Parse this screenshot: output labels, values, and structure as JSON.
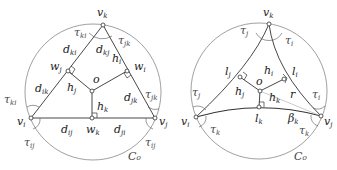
{
  "left_diagram": {
    "circle_label": "C₀",
    "vertices": {
      "vi": "v",
      "vi_sub": "i",
      "vj": "v",
      "vj_sub": "j",
      "vk": "v",
      "vk_sub": "k"
    },
    "center": "o",
    "feet": {
      "wi": "w",
      "wi_sub": "i",
      "wj": "w",
      "wj_sub": "j",
      "wk": "w",
      "wk_sub": "k"
    },
    "heights": {
      "hi": "h",
      "hi_sub": "i",
      "hj": "h",
      "hj_sub": "j",
      "hk": "h",
      "hk_sub": "k"
    },
    "distances": {
      "dki": "d",
      "dki_sub": "ki",
      "dkj": "d",
      "dkj_sub": "kj",
      "dik": "d",
      "dik_sub": "ik",
      "djk": "d",
      "djk_sub": "jk",
      "dij": "d",
      "dij_sub": "ij",
      "dji": "d",
      "dji_sub": "ji"
    },
    "angles": {
      "tki_top": "τ",
      "tki_top_sub": "ki",
      "tjk_top": "τ",
      "tjk_top_sub": "jk",
      "tki_left": "τ",
      "tki_left_sub": "ki",
      "tij_left": "τ",
      "tij_left_sub": "ij",
      "tjk_right": "τ",
      "tjk_right_sub": "jk",
      "tij_right": "τ",
      "tij_right_sub": "ij"
    }
  },
  "right_diagram": {
    "circle_label": "C₀",
    "vertices": {
      "vi": "v",
      "vi_sub": "i",
      "vj": "v",
      "vj_sub": "j",
      "vk": "v",
      "vk_sub": "k"
    },
    "center": "o",
    "feet": {
      "li": "l",
      "li_sub": "i",
      "lj": "l",
      "lj_sub": "j",
      "lk": "l",
      "lk_sub": "k"
    },
    "heights": {
      "hi": "h",
      "hi_sub": "i",
      "hj": "h",
      "hj_sub": "j",
      "hk": "h",
      "hk_sub": "k"
    },
    "radius": "r",
    "beta": "β",
    "beta_sub": "k",
    "angles": {
      "tj_top": "τ",
      "tj_top_sub": "j",
      "ti_top": "τ",
      "ti_top_sub": "i",
      "tj_left": "τ",
      "tj_left_sub": "j",
      "tk_left": "τ",
      "tk_left_sub": "k",
      "ti_right": "τ",
      "ti_right_sub": "i",
      "tk_right": "τ",
      "tk_right_sub": "k"
    }
  }
}
